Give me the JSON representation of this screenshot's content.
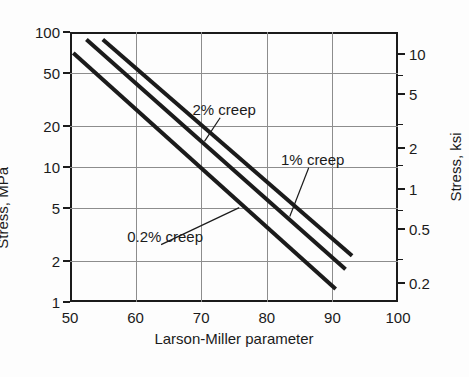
{
  "chart_data": {
    "type": "line",
    "title": "",
    "xlabel": "Larson-Miller parameter",
    "ylabel": "Stress, MPa",
    "ylabel_secondary": "Stress, ksi",
    "xlim": [
      50,
      100
    ],
    "ylim": [
      1,
      100
    ],
    "yscale": "log",
    "xscale": "linear",
    "grid": true,
    "legend_position": "inline-annotations",
    "xticks": [
      50,
      60,
      70,
      80,
      90,
      100
    ],
    "xtick_labels": [
      "50",
      "60",
      "70",
      "80",
      "90",
      "100"
    ],
    "yticks": [
      1,
      2,
      5,
      10,
      20,
      50,
      100
    ],
    "ytick_labels": [
      "1",
      "2",
      "5",
      "10",
      "20",
      "50",
      "100"
    ],
    "yticks_secondary": [
      0.2,
      0.5,
      1,
      2,
      5,
      10
    ],
    "ytick_labels_secondary": [
      "0.2",
      "0.5",
      "1",
      "2",
      "5",
      "10"
    ],
    "yticks_secondary_minor": [
      0.3,
      0.7,
      1.5,
      3,
      7
    ],
    "series": [
      {
        "name": "0.2% creep",
        "label": "0.2% creep",
        "color": "#1b1b1b",
        "x": [
          50.5,
          90.5
        ],
        "y": [
          70,
          1.25
        ],
        "label_x": 64.5,
        "label_y": 3.1,
        "leader_to_x": 75.8,
        "leader_to_y": 5.0
      },
      {
        "name": "1% creep",
        "label": "1% creep",
        "color": "#1b1b1b",
        "x": [
          52.5,
          92.0
        ],
        "y": [
          88,
          1.75
        ],
        "label_x": 87.0,
        "label_y": 11.5,
        "leader_to_x": 83.5,
        "leader_to_y": 4.3
      },
      {
        "name": "2% creep",
        "label": "2% creep",
        "color": "#1b1b1b",
        "x": [
          55.0,
          93.0
        ],
        "y": [
          88,
          2.2
        ],
        "label_x": 73.5,
        "label_y": 27.0,
        "leader_to_x": 70.5,
        "leader_to_y": 15.5
      }
    ]
  }
}
